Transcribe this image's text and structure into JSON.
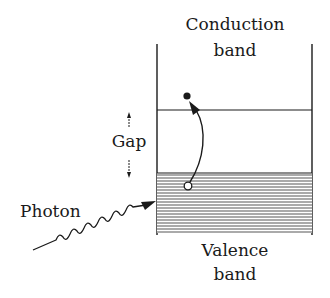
{
  "diagram": {
    "labels": {
      "conduction_line1": "Conduction",
      "conduction_line2": "band",
      "gap": "Gap",
      "photon": "Photon",
      "valence_line1": "Valence",
      "valence_line2": "band"
    },
    "elements": {
      "electron": "filled-dot (electron in conduction band)",
      "hole": "open-circle (hole in valence band)",
      "transition_arrow": "curved arrow from hole up to electron",
      "photon_arrow": "wavy arrow incident on valence band",
      "gap_arrows": "double-headed vertical arrow indicating gap"
    },
    "colors": {
      "ink": "#1a1a1a",
      "background": "#ffffff",
      "hatch": "#555555"
    }
  }
}
